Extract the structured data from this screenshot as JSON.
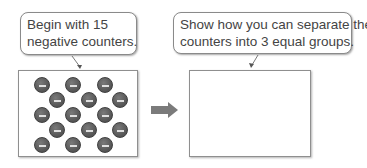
{
  "left_panel": {
    "caption": [
      "Begin with 15",
      "negative counters."
    ],
    "counter_count": 15,
    "counter_type": "negative",
    "counter_symbol": "minus",
    "counters": [
      {
        "x": 23,
        "y": 14
      },
      {
        "x": 54,
        "y": 14
      },
      {
        "x": 86,
        "y": 14
      },
      {
        "x": 38,
        "y": 29
      },
      {
        "x": 70,
        "y": 29
      },
      {
        "x": 101,
        "y": 29
      },
      {
        "x": 23,
        "y": 44
      },
      {
        "x": 54,
        "y": 44
      },
      {
        "x": 86,
        "y": 44
      },
      {
        "x": 38,
        "y": 59
      },
      {
        "x": 70,
        "y": 59
      },
      {
        "x": 101,
        "y": 59
      },
      {
        "x": 23,
        "y": 74
      },
      {
        "x": 54,
        "y": 74
      },
      {
        "x": 86,
        "y": 74
      }
    ]
  },
  "arrow": {
    "icon": "right-arrow-icon",
    "color": "#7b7b7b"
  },
  "right_panel": {
    "caption": [
      "Show how you can separate the",
      "counters into 3 equal groups."
    ],
    "content": ""
  },
  "colors": {
    "text": "#444444",
    "border": "#8a8a8a",
    "counter_fill": "#5c5c5c",
    "counter_mark": "#e0e0e0"
  }
}
